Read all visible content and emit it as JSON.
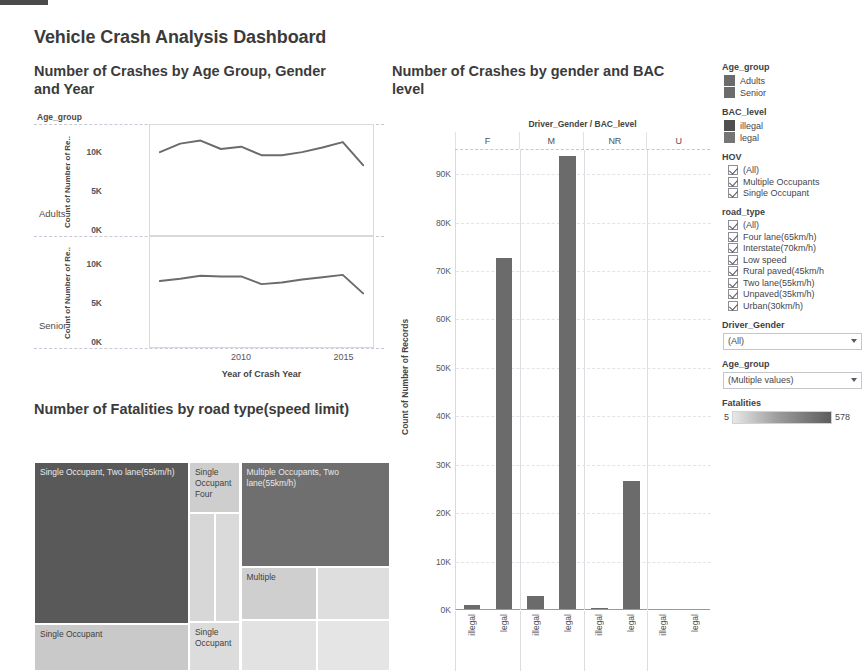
{
  "dashboard": {
    "title": "Vehicle Crash Analysis Dashboard"
  },
  "line_panel": {
    "title": "Number of  Crashes by Age Group, Gender and Year",
    "legend_caption": "Age_group",
    "row_labels": [
      "Adults",
      "Senior"
    ],
    "y_axis_title": "Count of Number of Re.. Count of Number of Re..",
    "y_title_adults": "Count of Number of Re..",
    "y_title_senior": "Count of Number of Re..",
    "x_axis_title": "Year of Crash Year"
  },
  "tree_panel": {
    "title": "Number of Fatalities by road type(speed limit)",
    "tiles": [
      {
        "label": "Single Occupant, Two lane(55km/h)",
        "shade": "dark"
      },
      {
        "label": "Single Occupant",
        "shade": "light"
      },
      {
        "label": "Single Occupant Four",
        "shade": "light"
      },
      {
        "label": "",
        "shade": "light"
      },
      {
        "label": "",
        "shade": "light"
      },
      {
        "label": "Single Occupant",
        "shade": "light"
      },
      {
        "label": "Multiple Occupants, Two lane(55km/h)",
        "shade": "dark"
      },
      {
        "label": "Multiple",
        "shade": "light"
      },
      {
        "label": "",
        "shade": "light"
      },
      {
        "label": "",
        "shade": "light"
      },
      {
        "label": "",
        "shade": "light"
      }
    ]
  },
  "bar_panel": {
    "title": "Number of Crashes by gender and BAC level",
    "column_header_title": "Driver_Gender / BAC_level"
  },
  "sidebar": {
    "age_group_legend": {
      "title": "Age_group",
      "items": [
        {
          "label": "Adults",
          "color": "#6b6b6b"
        },
        {
          "label": "Senior",
          "color": "#6b6b6b"
        }
      ]
    },
    "bac_level_legend": {
      "title": "BAC_level",
      "items": [
        {
          "label": "illegal",
          "color": "#4f4f4f"
        },
        {
          "label": "legal",
          "color": "#757575"
        }
      ]
    },
    "hov_filter": {
      "title": "HOV",
      "items": [
        {
          "label": "(All)",
          "checked": true
        },
        {
          "label": "Multiple Occupants",
          "checked": true
        },
        {
          "label": "Single Occupant",
          "checked": true
        }
      ]
    },
    "road_type_filter": {
      "title": "road_type",
      "items": [
        {
          "label": "(All)",
          "checked": true
        },
        {
          "label": "Four lane(65km/h)",
          "checked": true
        },
        {
          "label": "Interstate(70km/h)",
          "checked": true
        },
        {
          "label": "Low speed",
          "checked": true
        },
        {
          "label": "Rural paved(45km/h",
          "checked": true
        },
        {
          "label": "Two lane(55km/h)",
          "checked": true
        },
        {
          "label": "Unpaved(35km/h)",
          "checked": true
        },
        {
          "label": "Urban(30km/h)",
          "checked": true
        }
      ]
    },
    "driver_gender_filter": {
      "title": "Driver_Gender",
      "value": "(All)"
    },
    "age_group_filter": {
      "title": "Age_group",
      "value": "(Multiple values)"
    },
    "fatalities_legend": {
      "title": "Fatalities",
      "min": "5",
      "max": "578"
    }
  },
  "chart_data": [
    {
      "type": "line",
      "title": "Number of  Crashes by Age Group, Gender and Year",
      "xlabel": "Year of Crash Year",
      "ylabel": "Count of Number of Records",
      "x": [
        2006,
        2007,
        2008,
        2009,
        2010,
        2011,
        2012,
        2013,
        2014,
        2015,
        2016
      ],
      "xticks": [
        2010,
        2015
      ],
      "yticks": [
        "0K",
        "5K",
        "10K"
      ],
      "ylim": [
        0,
        12500
      ],
      "grid": false,
      "panels": [
        {
          "name": "Adults",
          "series": [
            {
              "name": "Adults",
              "values": [
                10000,
                11100,
                11500,
                10400,
                10700,
                9600,
                9600,
                10000,
                10600,
                11300,
                8300
              ],
              "color": "#6b6b6b"
            }
          ]
        },
        {
          "name": "Senior",
          "series": [
            {
              "name": "Senior",
              "values": [
                7800,
                8100,
                8500,
                8400,
                8400,
                7400,
                7600,
                8000,
                8300,
                8600,
                6200
              ],
              "color": "#6b6b6b"
            }
          ]
        }
      ]
    },
    {
      "type": "bar",
      "title": "Number of Crashes by gender and BAC level",
      "xlabel": "Driver_Gender / BAC_level",
      "ylabel": "Count of Number of Records",
      "ylim": [
        0,
        95000
      ],
      "yticks": [
        "0K",
        "10K",
        "20K",
        "30K",
        "40K",
        "50K",
        "60K",
        "70K",
        "80K",
        "90K"
      ],
      "grid": true,
      "groups": [
        "F",
        "M",
        "NR",
        "U"
      ],
      "subcategories": [
        "illegal",
        "legal"
      ],
      "bar_color": "#6b6b6b",
      "values": [
        {
          "group": "F",
          "category": "illegal",
          "value": 900
        },
        {
          "group": "F",
          "category": "legal",
          "value": 72500
        },
        {
          "group": "M",
          "category": "illegal",
          "value": 2700
        },
        {
          "group": "M",
          "category": "legal",
          "value": 93500
        },
        {
          "group": "NR",
          "category": "illegal",
          "value": 300
        },
        {
          "group": "NR",
          "category": "legal",
          "value": 26500
        },
        {
          "group": "U",
          "category": "illegal",
          "value": 0
        },
        {
          "group": "U",
          "category": "legal",
          "value": 0
        }
      ]
    },
    {
      "type": "treemap",
      "title": "Number of Fatalities by road type(speed limit)",
      "value_label": "Fatalities",
      "value_range": [
        5,
        578
      ],
      "tiles": [
        {
          "label": "Single Occupant, Two lane(55km/h)",
          "value": 578,
          "color": "#595959"
        },
        {
          "label": "Single Occupant",
          "value": 120,
          "color": "#c9c9c9"
        },
        {
          "label": "Single Occupant Four",
          "value": 115,
          "color": "#cecece"
        },
        {
          "label": "",
          "value": 70,
          "color": "#d7d7d7"
        },
        {
          "label": "",
          "value": 62,
          "color": "#dadada"
        },
        {
          "label": "Single Occupant",
          "value": 55,
          "color": "#dcdcdc"
        },
        {
          "label": "Multiple Occupants, Two lane(55km/h)",
          "value": 300,
          "color": "#6f6f6f"
        },
        {
          "label": "Multiple",
          "value": 95,
          "color": "#cfcfcf"
        },
        {
          "label": "",
          "value": 48,
          "color": "#dedede"
        },
        {
          "label": "",
          "value": 40,
          "color": "#e2e2e2"
        },
        {
          "label": "",
          "value": 30,
          "color": "#e5e5e5"
        }
      ]
    }
  ]
}
